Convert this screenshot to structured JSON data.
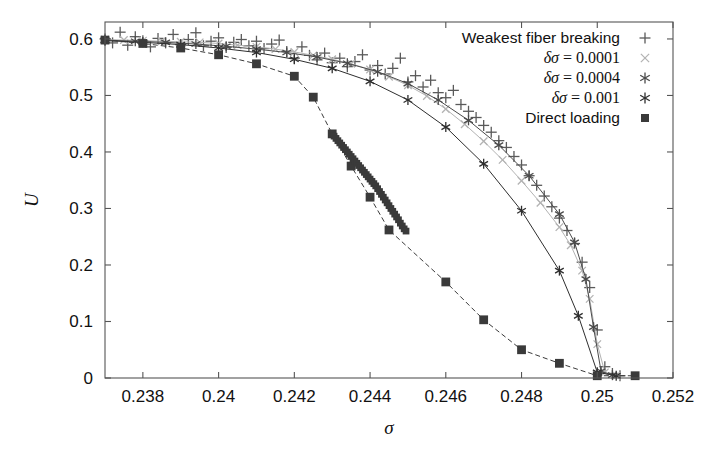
{
  "chart_data": {
    "type": "scatter",
    "title": "",
    "xlabel": "σ",
    "ylabel": "U",
    "xlim": [
      0.237,
      0.252
    ],
    "ylim": [
      0.0,
      0.63
    ],
    "xticks": [
      0.238,
      0.24,
      0.242,
      0.244,
      0.246,
      0.248,
      0.25,
      0.252
    ],
    "xticklabels": [
      "0.238",
      "0.24",
      "0.242",
      "0.244",
      "0.246",
      "0.248",
      "0.25",
      "0.252"
    ],
    "yticks": [
      0,
      0.1,
      0.2,
      0.3,
      0.4,
      0.5,
      0.6
    ],
    "yticklabels": [
      "0",
      "0.1",
      "0.2",
      "0.3",
      "0.4",
      "0.5",
      "0.6"
    ],
    "grid": false,
    "legend_position": "top-right",
    "series": [
      {
        "name": "Weakest fiber breaking",
        "marker": "plus",
        "color": "#5a5a5a",
        "linestyle": "none",
        "points": [
          [
            0.237,
            0.6
          ],
          [
            0.2372,
            0.593
          ],
          [
            0.2374,
            0.612
          ],
          [
            0.2376,
            0.589
          ],
          [
            0.2378,
            0.604
          ],
          [
            0.238,
            0.597
          ],
          [
            0.2382,
            0.586
          ],
          [
            0.2384,
            0.601
          ],
          [
            0.2386,
            0.593
          ],
          [
            0.2388,
            0.608
          ],
          [
            0.239,
            0.59
          ],
          [
            0.2392,
            0.599
          ],
          [
            0.2394,
            0.611
          ],
          [
            0.2396,
            0.588
          ],
          [
            0.2398,
            0.596
          ],
          [
            0.24,
            0.602
          ],
          [
            0.2402,
            0.585
          ],
          [
            0.2404,
            0.594
          ],
          [
            0.2406,
            0.599
          ],
          [
            0.2408,
            0.588
          ],
          [
            0.241,
            0.596
          ],
          [
            0.2412,
            0.583
          ],
          [
            0.2414,
            0.591
          ],
          [
            0.2416,
            0.598
          ],
          [
            0.2418,
            0.578
          ],
          [
            0.242,
            0.566
          ],
          [
            0.2422,
            0.586
          ],
          [
            0.2424,
            0.571
          ],
          [
            0.2426,
            0.563
          ],
          [
            0.2428,
            0.575
          ],
          [
            0.243,
            0.558
          ],
          [
            0.2432,
            0.566
          ],
          [
            0.2434,
            0.551
          ],
          [
            0.2436,
            0.56
          ],
          [
            0.2438,
            0.572
          ],
          [
            0.244,
            0.545
          ],
          [
            0.2442,
            0.553
          ],
          [
            0.2444,
            0.538
          ],
          [
            0.2446,
            0.548
          ],
          [
            0.2448,
            0.566
          ],
          [
            0.245,
            0.524
          ],
          [
            0.2452,
            0.535
          ],
          [
            0.2454,
            0.515
          ],
          [
            0.2456,
            0.527
          ],
          [
            0.2458,
            0.505
          ],
          [
            0.246,
            0.496
          ],
          [
            0.2462,
            0.509
          ],
          [
            0.2464,
            0.484
          ],
          [
            0.2466,
            0.472
          ],
          [
            0.2468,
            0.461
          ],
          [
            0.247,
            0.447
          ],
          [
            0.2472,
            0.435
          ],
          [
            0.2474,
            0.42
          ],
          [
            0.2476,
            0.408
          ],
          [
            0.2478,
            0.392
          ],
          [
            0.248,
            0.377
          ],
          [
            0.2482,
            0.358
          ],
          [
            0.2484,
            0.341
          ],
          [
            0.2486,
            0.322
          ],
          [
            0.2488,
            0.303
          ],
          [
            0.249,
            0.283
          ],
          [
            0.2492,
            0.261
          ],
          [
            0.2494,
            0.238
          ],
          [
            0.2496,
            0.205
          ],
          [
            0.2498,
            0.16
          ],
          [
            0.25,
            0.085
          ],
          [
            0.2502,
            0.02
          ],
          [
            0.2504,
            0.008
          ],
          [
            0.2506,
            0.004
          ]
        ]
      },
      {
        "name": "δσ = 0.0001",
        "marker": "cross",
        "color": "#b3b3b3",
        "linestyle": "solid",
        "points": [
          [
            0.237,
            0.599
          ],
          [
            0.2375,
            0.598
          ],
          [
            0.238,
            0.597
          ],
          [
            0.2385,
            0.596
          ],
          [
            0.239,
            0.595
          ],
          [
            0.2395,
            0.594
          ],
          [
            0.24,
            0.592
          ],
          [
            0.2405,
            0.589
          ],
          [
            0.241,
            0.586
          ],
          [
            0.2415,
            0.582
          ],
          [
            0.242,
            0.577
          ],
          [
            0.2425,
            0.571
          ],
          [
            0.243,
            0.564
          ],
          [
            0.2435,
            0.556
          ],
          [
            0.244,
            0.546
          ],
          [
            0.2445,
            0.533
          ],
          [
            0.245,
            0.518
          ],
          [
            0.2455,
            0.499
          ],
          [
            0.246,
            0.476
          ],
          [
            0.2465,
            0.449
          ],
          [
            0.247,
            0.419
          ],
          [
            0.2475,
            0.386
          ],
          [
            0.248,
            0.349
          ],
          [
            0.2485,
            0.31
          ],
          [
            0.249,
            0.267
          ],
          [
            0.2493,
            0.235
          ],
          [
            0.2496,
            0.19
          ],
          [
            0.2498,
            0.14
          ],
          [
            0.25,
            0.06
          ],
          [
            0.2502,
            0.01
          ],
          [
            0.2505,
            0.004
          ]
        ]
      },
      {
        "name": "δσ = 0.0004",
        "marker": "asterisk",
        "color": "#4a4a4a",
        "linestyle": "solid",
        "points": [
          [
            0.237,
            0.598
          ],
          [
            0.2378,
            0.596
          ],
          [
            0.2386,
            0.594
          ],
          [
            0.2394,
            0.591
          ],
          [
            0.2402,
            0.587
          ],
          [
            0.241,
            0.582
          ],
          [
            0.2418,
            0.576
          ],
          [
            0.2426,
            0.568
          ],
          [
            0.2434,
            0.557
          ],
          [
            0.2442,
            0.542
          ],
          [
            0.245,
            0.521
          ],
          [
            0.2458,
            0.492
          ],
          [
            0.2466,
            0.456
          ],
          [
            0.2474,
            0.412
          ],
          [
            0.2482,
            0.358
          ],
          [
            0.249,
            0.29
          ],
          [
            0.2494,
            0.24
          ],
          [
            0.2497,
            0.175
          ],
          [
            0.2499,
            0.09
          ],
          [
            0.2501,
            0.012
          ],
          [
            0.2504,
            0.005
          ]
        ]
      },
      {
        "name": "δσ = 0.001",
        "marker": "asterisk",
        "color": "#2e2e2e",
        "linestyle": "solid",
        "points": [
          [
            0.237,
            0.597
          ],
          [
            0.238,
            0.594
          ],
          [
            0.239,
            0.59
          ],
          [
            0.24,
            0.584
          ],
          [
            0.241,
            0.576
          ],
          [
            0.242,
            0.564
          ],
          [
            0.243,
            0.548
          ],
          [
            0.244,
            0.525
          ],
          [
            0.245,
            0.492
          ],
          [
            0.246,
            0.444
          ],
          [
            0.247,
            0.379
          ],
          [
            0.248,
            0.296
          ],
          [
            0.249,
            0.19
          ],
          [
            0.2495,
            0.11
          ],
          [
            0.25,
            0.01
          ],
          [
            0.2505,
            0.004
          ]
        ]
      },
      {
        "name": "Direct loading",
        "marker": "filled-square",
        "color": "#3a3a3a",
        "linestyle": "dashed",
        "points": [
          [
            0.237,
            0.598
          ],
          [
            0.238,
            0.592
          ],
          [
            0.239,
            0.584
          ],
          [
            0.24,
            0.572
          ],
          [
            0.241,
            0.556
          ],
          [
            0.242,
            0.534
          ],
          [
            0.2425,
            0.497
          ],
          [
            0.243,
            0.432
          ],
          [
            0.2435,
            0.375
          ],
          [
            0.244,
            0.32
          ],
          [
            0.2445,
            0.262
          ],
          [
            0.246,
            0.17
          ],
          [
            0.247,
            0.103
          ],
          [
            0.248,
            0.05
          ],
          [
            0.249,
            0.026
          ],
          [
            0.25,
            0.004
          ],
          [
            0.251,
            0.004
          ]
        ],
        "dense_points": [
          [
            0.243,
            0.432
          ],
          [
            0.24305,
            0.428
          ],
          [
            0.2431,
            0.424
          ],
          [
            0.24315,
            0.42
          ],
          [
            0.2432,
            0.416
          ],
          [
            0.24325,
            0.412
          ],
          [
            0.2433,
            0.408
          ],
          [
            0.24335,
            0.404
          ],
          [
            0.2434,
            0.4
          ],
          [
            0.24345,
            0.396
          ],
          [
            0.2435,
            0.392
          ],
          [
            0.24355,
            0.388
          ],
          [
            0.2436,
            0.384
          ],
          [
            0.24365,
            0.38
          ],
          [
            0.2437,
            0.376
          ],
          [
            0.24375,
            0.372
          ],
          [
            0.2438,
            0.368
          ],
          [
            0.24385,
            0.364
          ],
          [
            0.2439,
            0.36
          ],
          [
            0.24395,
            0.356
          ],
          [
            0.244,
            0.352
          ],
          [
            0.24405,
            0.348
          ],
          [
            0.2441,
            0.344
          ],
          [
            0.24415,
            0.34
          ],
          [
            0.2442,
            0.335
          ],
          [
            0.24425,
            0.33
          ],
          [
            0.2443,
            0.325
          ],
          [
            0.24435,
            0.32
          ],
          [
            0.2444,
            0.315
          ],
          [
            0.24445,
            0.31
          ],
          [
            0.2445,
            0.305
          ],
          [
            0.24455,
            0.3
          ],
          [
            0.2446,
            0.295
          ],
          [
            0.24465,
            0.29
          ],
          [
            0.2447,
            0.285
          ],
          [
            0.24475,
            0.28
          ],
          [
            0.2448,
            0.274
          ],
          [
            0.24485,
            0.269
          ],
          [
            0.2449,
            0.264
          ],
          [
            0.24495,
            0.26
          ]
        ]
      }
    ]
  },
  "legend": {
    "entries": [
      {
        "label": "Weakest fiber breaking",
        "marker": "plus",
        "color": "#5a5a5a",
        "math": false
      },
      {
        "label": "δσ = 0.0001",
        "marker": "cross",
        "color": "#b3b3b3",
        "math": true
      },
      {
        "label": "δσ = 0.0004",
        "marker": "asterisk",
        "color": "#4a4a4a",
        "math": true
      },
      {
        "label": "δσ = 0.001",
        "marker": "asterisk",
        "color": "#2e2e2e",
        "math": true
      },
      {
        "label": "Direct loading",
        "marker": "filled-square",
        "color": "#3a3a3a",
        "math": false
      }
    ]
  },
  "colors": {
    "frame": "#555555",
    "text": "#111111",
    "background": "#ffffff"
  }
}
